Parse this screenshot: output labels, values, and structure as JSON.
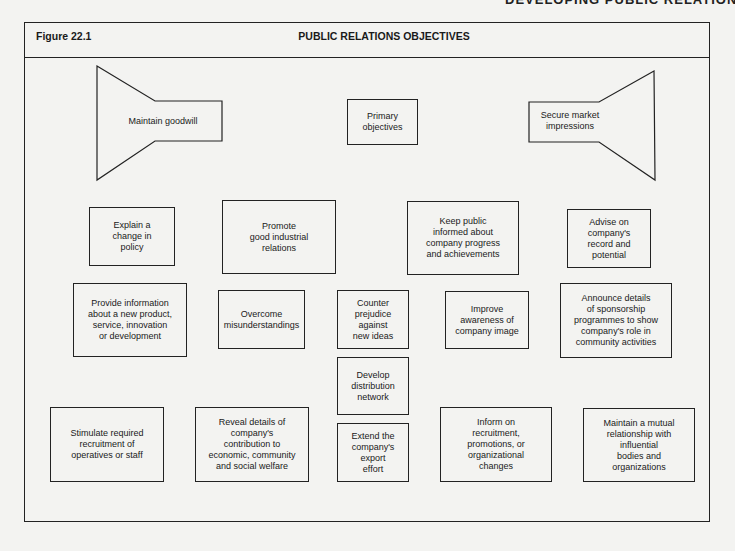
{
  "running_head": "DEVELOPING PUBLIC RELATIONS",
  "figure": {
    "label": "Figure 22.1",
    "title": "PUBLIC RELATIONS OBJECTIVES"
  },
  "top_row": {
    "left_funnel": "Maintain goodwill",
    "center": "Primary\nobjectives",
    "right_funnel": "Secure market\nimpressions"
  },
  "boxes": [
    {
      "id": "explain-policy",
      "text": "Explain a\nchange in\npolicy"
    },
    {
      "id": "promote-industrial",
      "text": "Promote\ngood industrial\nrelations"
    },
    {
      "id": "keep-public-informed",
      "text": "Keep public\ninformed about\ncompany progress\nand achievements"
    },
    {
      "id": "advise-record",
      "text": "Advise on\ncompany's\nrecord and\npotential"
    },
    {
      "id": "provide-info",
      "text": "Provide information\nabout a new product,\nservice, innovation\nor development"
    },
    {
      "id": "overcome-misunderstandings",
      "text": "Overcome\nmisunderstandings"
    },
    {
      "id": "counter-prejudice",
      "text": "Counter\nprejudice\nagainst\nnew ideas"
    },
    {
      "id": "improve-awareness",
      "text": "Improve\nawareness of\ncompany image"
    },
    {
      "id": "announce-sponsorship",
      "text": "Announce details\nof sponsorship\nprogrammes to show\ncompany's role in\ncommunity activities"
    },
    {
      "id": "develop-distribution",
      "text": "Develop\ndistribution\nnetwork"
    },
    {
      "id": "stimulate-recruitment",
      "text": "Stimulate required\nrecruitment of\noperatives or staff"
    },
    {
      "id": "reveal-contribution",
      "text": "Reveal details of\ncompany's\ncontribution to\neconomic, community\nand social welfare"
    },
    {
      "id": "extend-export",
      "text": "Extend the\ncompany's\nexport\neffort"
    },
    {
      "id": "inform-recruitment",
      "text": "Inform on\nrecruitment,\npromotions, or\norganizational\nchanges"
    },
    {
      "id": "maintain-relationship",
      "text": "Maintain a mutual\nrelationship with\ninfluential\nbodies and\norganizations"
    }
  ],
  "colors": {
    "line": "#222222",
    "background": "#f3f3f1"
  }
}
